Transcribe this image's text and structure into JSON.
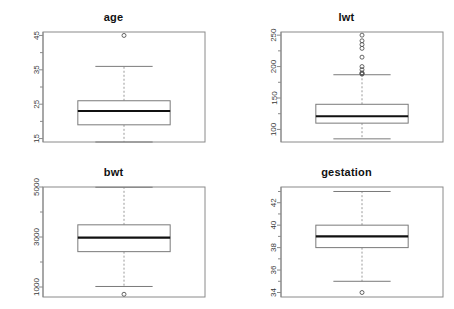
{
  "figure": {
    "layout": "2x2 panel grid of boxplots",
    "background_color": "#ffffff",
    "frame_color": "#8a8a8a",
    "box_color": "#7a7a7a",
    "median_color": "#111111",
    "whisker_color": "#9a9a9a",
    "outlier_color": "#555555"
  },
  "chart_data": [
    {
      "type": "box",
      "title": "age",
      "xlabel": "",
      "ylabel": "",
      "ylim": [
        14,
        46
      ],
      "grid": false,
      "legend": "none",
      "ticks": [
        15,
        25,
        35,
        45
      ],
      "tick_labels": [
        "15",
        "25",
        "35",
        "45"
      ],
      "minor_ticks": [
        20,
        30,
        40
      ],
      "stats": {
        "min": 14,
        "q1": 19,
        "median": 23,
        "q3": 26,
        "max": 36
      },
      "outliers": [
        45
      ]
    },
    {
      "type": "box",
      "title": "lwt",
      "xlabel": "",
      "ylabel": "",
      "ylim": [
        80,
        255
      ],
      "grid": false,
      "legend": "none",
      "ticks": [
        100,
        150,
        200,
        250
      ],
      "tick_labels": [
        "100",
        "150",
        "200",
        "250"
      ],
      "minor_ticks": [
        125,
        175,
        225
      ],
      "stats": {
        "min": 85,
        "q1": 110,
        "median": 121,
        "q3": 140,
        "max": 187
      },
      "outliers": [
        250,
        241,
        235,
        229,
        215,
        200,
        195,
        190,
        189,
        188
      ]
    },
    {
      "type": "box",
      "title": "bwt",
      "xlabel": "",
      "ylabel": "",
      "ylim": [
        600,
        5000
      ],
      "grid": false,
      "legend": "none",
      "ticks": [
        1000,
        3000,
        5000
      ],
      "tick_labels": [
        "1000",
        "3000",
        "5000"
      ],
      "minor_ticks": [
        2000,
        4000
      ],
      "stats": {
        "min": 1021,
        "q1": 2414,
        "median": 2977,
        "q3": 3487,
        "max": 4990
      },
      "outliers": [
        709
      ]
    },
    {
      "type": "box",
      "title": "gestation",
      "xlabel": "",
      "ylabel": "",
      "ylim": [
        33.6,
        43.4
      ],
      "grid": false,
      "legend": "none",
      "ticks": [
        34,
        36,
        38,
        40,
        42
      ],
      "tick_labels": [
        "34",
        "36",
        "38",
        "40",
        "42"
      ],
      "minor_ticks": [
        35,
        37,
        39,
        41,
        43
      ],
      "stats": {
        "min": 35,
        "q1": 38,
        "median": 39,
        "q3": 40,
        "max": 43
      },
      "outliers": [
        34
      ]
    }
  ]
}
